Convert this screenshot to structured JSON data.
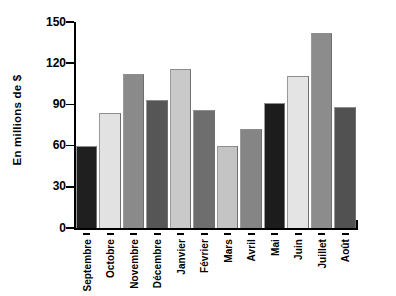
{
  "chart_data": {
    "type": "bar",
    "title": "",
    "subtitle": "",
    "xlabel": "",
    "ylabel": "En millions de $",
    "categories": [
      "Septembre",
      "Octobre",
      "Novembre",
      "Décembre",
      "Janvier",
      "Février",
      "Mars",
      "Avril",
      "Mai",
      "Juin",
      "Juillet",
      "Août"
    ],
    "values": [
      60,
      84,
      112,
      93,
      116,
      86,
      60,
      72,
      91,
      111,
      142,
      88
    ],
    "bar_colors": [
      "#1f1f1f",
      "#e2e2e2",
      "#8a8a8a",
      "#565656",
      "#c9c9c9",
      "#6e6e6e",
      "#c4c4c4",
      "#858585",
      "#1c1c1c",
      "#e4e4e4",
      "#8c8c8c",
      "#515151"
    ],
    "ylim": [
      0,
      150
    ],
    "yticks": [
      0,
      30,
      60,
      90,
      120,
      150
    ],
    "ytick_labels": [
      "0",
      "30",
      "60",
      "90",
      "120",
      "150"
    ],
    "grid": false,
    "legend": null,
    "axis_color": "#000000",
    "background": "#ffffff"
  }
}
